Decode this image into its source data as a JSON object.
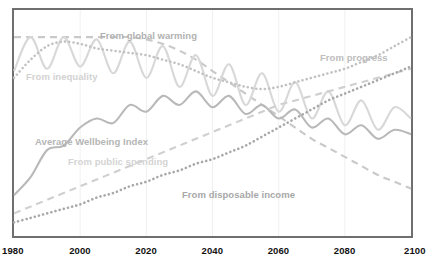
{
  "chart_data": {
    "type": "line",
    "title": "",
    "xlabel": "",
    "ylabel": "",
    "xlim": [
      1980,
      2100
    ],
    "ylim": [
      0,
      100
    ],
    "grid": true,
    "legend_position": "inline-labels",
    "x_ticks": [
      "1980",
      "2000",
      "2020",
      "2040",
      "2060",
      "2080",
      "2100"
    ],
    "x": [
      1980,
      1985,
      1990,
      1995,
      2000,
      2005,
      2010,
      2015,
      2020,
      2025,
      2030,
      2035,
      2040,
      2045,
      2050,
      2055,
      2060,
      2065,
      2070,
      2075,
      2080,
      2085,
      2090,
      2095,
      2100
    ],
    "series": [
      {
        "name": "From global warming",
        "style": "dashed",
        "color": "#c9c9c9",
        "label_color": "#b2b2b2",
        "values": [
          88,
          88,
          88,
          88,
          88,
          88,
          88,
          88,
          87,
          85,
          82,
          78,
          73,
          68,
          63,
          58,
          53,
          48,
          43,
          39,
          35,
          31,
          27,
          24,
          21
        ]
      },
      {
        "name": "From inequality",
        "style": "solid",
        "color": "#d8d8d8",
        "label_color": "#d2d2d2",
        "values": [
          73,
          88,
          74,
          88,
          75,
          87,
          72,
          86,
          70,
          84,
          66,
          80,
          62,
          76,
          58,
          72,
          55,
          68,
          52,
          64,
          49,
          60,
          47,
          57,
          52
        ]
      },
      {
        "name": "From progress",
        "style": "dotted",
        "color": "#c2c2c2",
        "label_color": "#bdbdbd",
        "values": [
          70,
          78,
          84,
          86,
          85,
          83,
          82,
          81,
          80,
          78,
          76,
          73,
          70,
          68,
          66,
          65,
          66,
          68,
          70,
          72,
          74,
          77,
          80,
          84,
          88
        ]
      },
      {
        "name": "Average Wellbeing Index",
        "style": "solid",
        "color": "#b9b9b9",
        "label_color": "#b5b5b5",
        "values": [
          18,
          26,
          38,
          40,
          48,
          52,
          50,
          58,
          55,
          62,
          58,
          64,
          57,
          62,
          54,
          58,
          52,
          56,
          48,
          52,
          45,
          49,
          43,
          47,
          45
        ]
      },
      {
        "name": "From public spending",
        "style": "dashed",
        "color": "#cfcfcf",
        "label_color": "#d4d4d4",
        "values": [
          10,
          13,
          16,
          19,
          22,
          25,
          28,
          31,
          34,
          37,
          40,
          43,
          46,
          49,
          52,
          55,
          58,
          60,
          62,
          64,
          66,
          68,
          70,
          72,
          74
        ]
      },
      {
        "name": "From disposable income",
        "style": "dotted",
        "color": "#a8a8a8",
        "label_color": "#a8a8a8",
        "values": [
          6,
          8,
          10,
          12,
          14,
          17,
          19,
          22,
          24,
          27,
          29,
          32,
          34,
          37,
          40,
          44,
          48,
          52,
          56,
          60,
          63,
          66,
          69,
          72,
          75
        ]
      }
    ]
  },
  "axis": {
    "ticks": [
      {
        "label": "1980"
      },
      {
        "label": "2000"
      },
      {
        "label": "2020"
      },
      {
        "label": "2040"
      },
      {
        "label": "2060"
      },
      {
        "label": "2080"
      },
      {
        "label": "2100"
      }
    ]
  },
  "labels": {
    "global_warming": "From global warming",
    "progress": "From progress",
    "inequality": "From inequality",
    "wellbeing": "Average Wellbeing Index",
    "public_spending": "From public spending",
    "disposable_income": "From disposable income"
  },
  "colors": {
    "frame": "#6f6f6f",
    "grid": "#f0f0f0",
    "background": "#ffffff",
    "axis_text": "#111111"
  }
}
